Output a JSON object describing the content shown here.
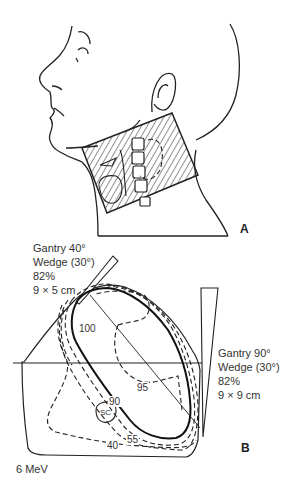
{
  "panel_a": {
    "label": "A",
    "description": "Lateral head and neck with hatched treatment field"
  },
  "panel_b": {
    "label": "B",
    "energy": "6 MeV",
    "beam_left": {
      "line1": "Gantry 40°",
      "line2": "Wedge (30°)",
      "line3": "82%",
      "line4": "9 × 5 cm"
    },
    "beam_right": {
      "line1": "Gantry 90°",
      "line2": "Wedge (30°)",
      "line3": "82%",
      "line4": "9 × 9 cm"
    },
    "isodose_labels": {
      "l100": "100",
      "l95": "95",
      "l90": "90",
      "l55": "55",
      "l40": "40",
      "sc": "SC"
    }
  },
  "colors": {
    "line": "#222222",
    "background": "#ffffff"
  }
}
